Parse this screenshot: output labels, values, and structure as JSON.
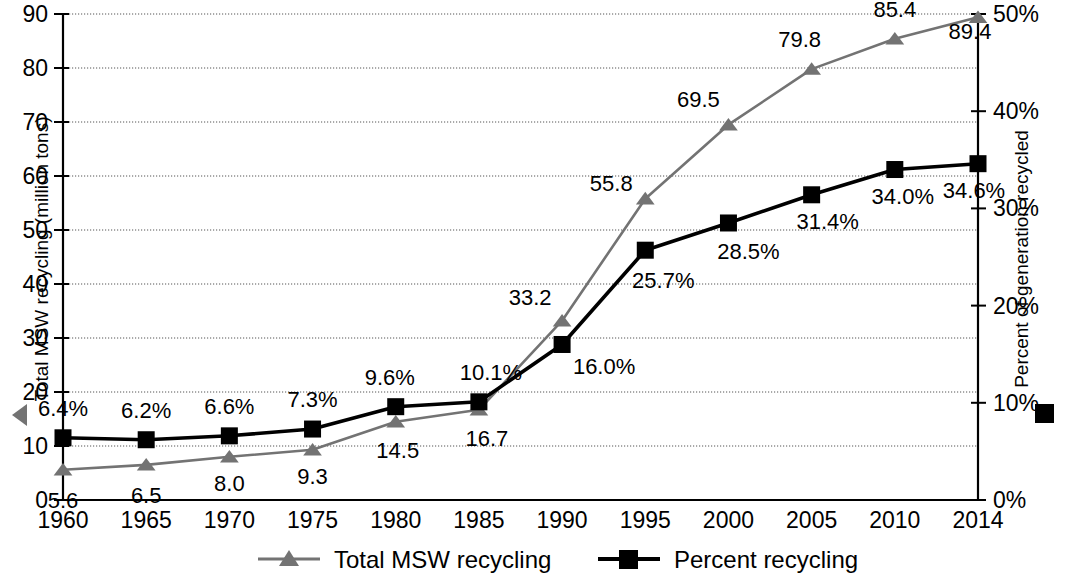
{
  "chart_data": {
    "type": "line",
    "title": "",
    "xlabel": "",
    "categories": [
      "1960",
      "1965",
      "1970",
      "1975",
      "1980",
      "1985",
      "1990",
      "1995",
      "2000",
      "2005",
      "2010",
      "2014"
    ],
    "x_values": [
      1960,
      1965,
      1970,
      1975,
      1980,
      1985,
      1990,
      1995,
      2000,
      2005,
      2010,
      2014
    ],
    "grid": true,
    "legend_position": "bottom",
    "series": [
      {
        "name": "Total MSW recycling",
        "axis": "left",
        "marker": "triangle",
        "color": "#737373",
        "unit": "million tons",
        "values": [
          5.6,
          6.5,
          8.0,
          9.3,
          14.5,
          16.7,
          33.2,
          55.8,
          69.5,
          79.8,
          85.4,
          89.4
        ],
        "labels": [
          "5.6",
          "6.5",
          "8.0",
          "9.3",
          "14.5",
          "16.7",
          "33.2",
          "55.8",
          "69.5",
          "79.8",
          "85.4",
          "89.4"
        ]
      },
      {
        "name": "Percent recycling",
        "axis": "right",
        "marker": "square",
        "color": "#000000",
        "unit": "percent",
        "values": [
          6.4,
          6.2,
          6.6,
          7.3,
          9.6,
          10.1,
          16.0,
          25.7,
          28.5,
          31.4,
          34.0,
          34.6
        ],
        "labels": [
          "6.4%",
          "6.2%",
          "6.6%",
          "7.3%",
          "9.6%",
          "10.1%",
          "16.0%",
          "25.7%",
          "28.5%",
          "31.4%",
          "34.0%",
          "34.6%"
        ]
      }
    ],
    "y_left": {
      "label": "Total MSW recycling (million tons)",
      "ylim": [
        0,
        90
      ],
      "ticks": [
        0,
        10,
        20,
        30,
        40,
        50,
        60,
        70,
        80,
        90
      ],
      "tick_labels": [
        "0",
        "10",
        "20",
        "30",
        "40",
        "50",
        "60",
        "70",
        "80",
        "90"
      ],
      "marker": "triangle-left"
    },
    "y_right": {
      "label": "Percent of generation recycled",
      "ylim": [
        0,
        50
      ],
      "ticks": [
        0,
        10,
        20,
        30,
        40,
        50
      ],
      "tick_labels": [
        "0%",
        "10%",
        "20%",
        "30%",
        "40%",
        "50%"
      ],
      "marker": "square"
    },
    "legend": [
      {
        "label": "Total MSW recycling",
        "marker": "triangle",
        "color": "#737373"
      },
      {
        "label": "Percent recycling",
        "marker": "square",
        "color": "#000000"
      }
    ]
  }
}
